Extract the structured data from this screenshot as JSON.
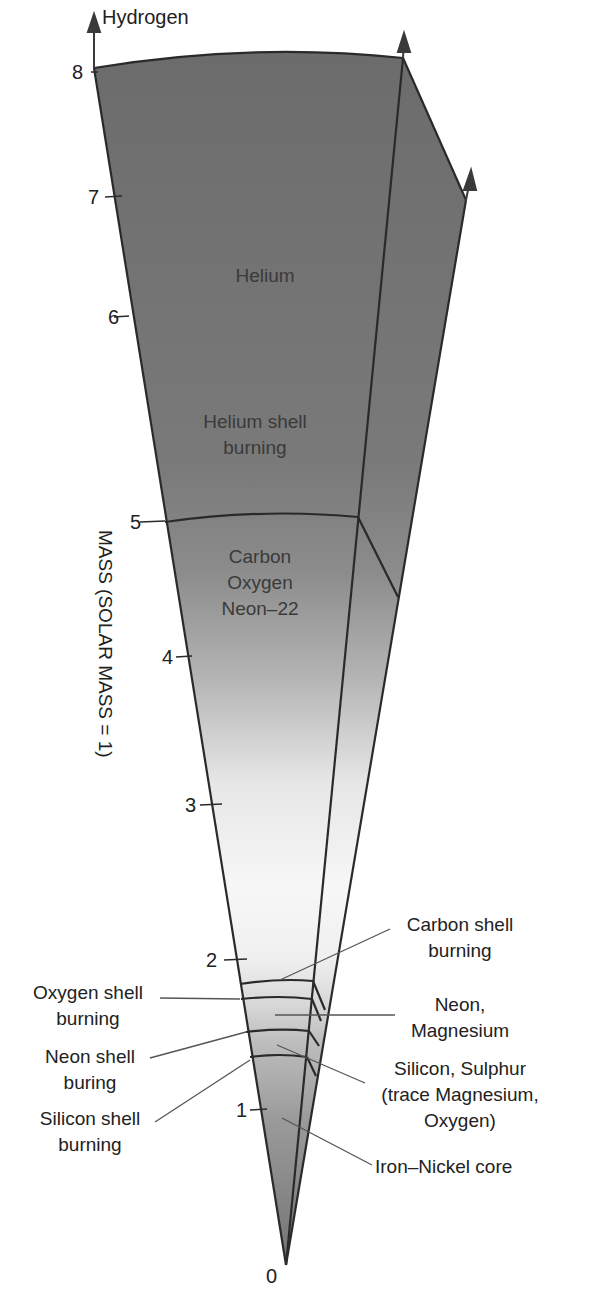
{
  "diagram": {
    "axis": {
      "label": "MASS (SOLAR MASS = 1)",
      "ticks": [
        "0",
        "1",
        "2",
        "3",
        "4",
        "5",
        "6",
        "7",
        "8"
      ]
    },
    "top_label": "Hydrogen",
    "inner_labels": {
      "helium": "Helium",
      "helium_shell_1": "Helium shell",
      "helium_shell_2": "burning",
      "cone_1": "Carbon",
      "cone_2": "Oxygen",
      "cone_3": "Neon–22"
    },
    "left_callouts": {
      "oxygen_shell_1": "Oxygen shell",
      "oxygen_shell_2": "burning",
      "neon_shell_1": "Neon shell",
      "neon_shell_2": "buring",
      "silicon_shell_1": "Silicon shell",
      "silicon_shell_2": "burning"
    },
    "right_callouts": {
      "carbon_shell_1": "Carbon shell",
      "carbon_shell_2": "burning",
      "neon_mg_1": "Neon,",
      "neon_mg_2": "Magnesium",
      "si_s_1": "Silicon, Sulphur",
      "si_s_2": "(trace Magnesium,",
      "si_s_3": "Oxygen)",
      "core": "Iron–Nickel core"
    },
    "colors": {
      "dark_gray": "#6e6e6e",
      "light": "#f4f4f4",
      "line": "#2a2a2a"
    }
  }
}
